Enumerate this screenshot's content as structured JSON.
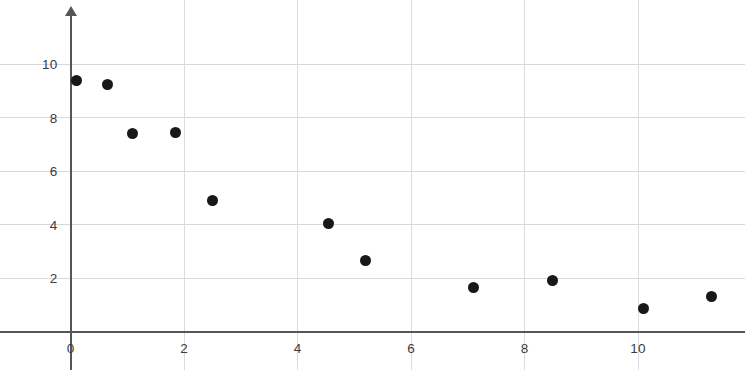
{
  "chart_data": {
    "type": "scatter",
    "title": "",
    "subtitle": "",
    "xlabel": "",
    "ylabel": "",
    "xlim": [
      -1.2,
      11.9
    ],
    "ylim": [
      0,
      11.2
    ],
    "grid": true,
    "legend": null,
    "legend_position": "none",
    "marker_color": "#18181a",
    "axis_color": "#55565c",
    "grid_color": "#d8d8dc",
    "x_ticks": [
      0,
      2,
      4,
      6,
      8,
      10
    ],
    "x_tick_labels": [
      "0",
      "2",
      "4",
      "6",
      "8",
      "10"
    ],
    "y_ticks": [
      2,
      4,
      6,
      8,
      10
    ],
    "y_tick_labels": [
      "2",
      "4",
      "6",
      "8",
      "10"
    ],
    "points": [
      {
        "x": 0.1,
        "y": 9.4
      },
      {
        "x": 0.65,
        "y": 9.25
      },
      {
        "x": 1.1,
        "y": 7.4
      },
      {
        "x": 1.85,
        "y": 7.45
      },
      {
        "x": 2.5,
        "y": 4.9
      },
      {
        "x": 4.55,
        "y": 4.05
      },
      {
        "x": 5.2,
        "y": 2.65
      },
      {
        "x": 7.1,
        "y": 1.65
      },
      {
        "x": 8.5,
        "y": 1.9
      },
      {
        "x": 10.1,
        "y": 0.85
      },
      {
        "x": 11.3,
        "y": 1.3
      }
    ],
    "values": [
      9.4,
      9.25,
      7.4,
      7.45,
      4.9,
      4.05,
      2.65,
      1.65,
      1.9,
      0.85,
      1.3
    ],
    "x": [
      0.1,
      0.65,
      1.1,
      1.85,
      2.5,
      4.55,
      5.2,
      7.1,
      8.5,
      10.1,
      11.3
    ]
  },
  "figure": {
    "description": "Scatter plot showing a decreasing trend",
    "background": "#ffffff"
  }
}
